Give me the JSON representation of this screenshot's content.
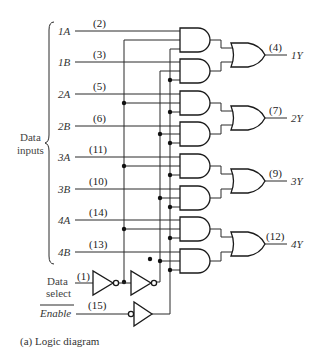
{
  "diagram": {
    "caption": "(a)  Logic diagram",
    "group_label_line1": "Data",
    "group_label_line2": "inputs",
    "inputs": [
      {
        "name": "1A",
        "pin": "(2)"
      },
      {
        "name": "1B",
        "pin": "(3)"
      },
      {
        "name": "2A",
        "pin": "(5)"
      },
      {
        "name": "2B",
        "pin": "(6)"
      },
      {
        "name": "3A",
        "pin": "(11)"
      },
      {
        "name": "3B",
        "pin": "(10)"
      },
      {
        "name": "4A",
        "pin": "(14)"
      },
      {
        "name": "4B",
        "pin": "(13)"
      }
    ],
    "outputs": [
      {
        "name": "1Y",
        "pin": "(4)"
      },
      {
        "name": "2Y",
        "pin": "(7)"
      },
      {
        "name": "3Y",
        "pin": "(9)"
      },
      {
        "name": "4Y",
        "pin": "(12)"
      }
    ],
    "select": {
      "line1": "Data",
      "line2": "select",
      "pin": "(1)"
    },
    "enable": {
      "label": "Enable",
      "pin": "(15)",
      "active_low": true
    },
    "gates": {
      "and_count": 8,
      "or_count": 4,
      "inverter_count": 3
    }
  }
}
